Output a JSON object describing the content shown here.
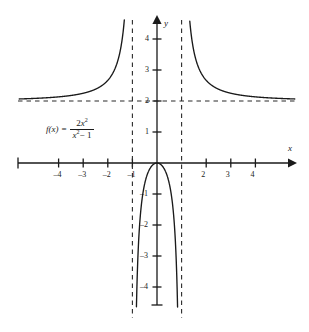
{
  "figure": {
    "background_color": "#ffffff",
    "ink_color": "#1a1a1a"
  },
  "function_label": {
    "f_name": "f(x)",
    "equals": "=",
    "numerator_coefficient": "2",
    "numerator_variable": "x",
    "numerator_exponent": "2",
    "denominator_variable": "x",
    "denominator_exponent": "2",
    "denominator_rest": "− 1",
    "plain_text": "f(x) = 2x^2 / (x^2 - 1)"
  },
  "axes": {
    "x_axis_name": "x",
    "y_axis_name": "y",
    "x_ticks": [
      {
        "value": -4,
        "label": "–4"
      },
      {
        "value": -3,
        "label": "–3"
      },
      {
        "value": -2,
        "label": "–2"
      },
      {
        "value": -1,
        "label": "–1"
      },
      {
        "value": 2,
        "label": "2"
      },
      {
        "value": 3,
        "label": "3"
      },
      {
        "value": 4,
        "label": "4"
      }
    ],
    "y_ticks": [
      {
        "value": 4,
        "label": "4"
      },
      {
        "value": 3,
        "label": "3"
      },
      {
        "value": 2,
        "label": "2"
      },
      {
        "value": 1,
        "label": "1"
      },
      {
        "value": -1,
        "label": "–1"
      },
      {
        "value": -2,
        "label": "–2"
      },
      {
        "value": -3,
        "label": "–3"
      },
      {
        "value": -4,
        "label": "–4"
      }
    ]
  },
  "chart_data": {
    "type": "line",
    "title": "",
    "subtitle": "",
    "xlabel": "x",
    "ylabel": "y",
    "grid": false,
    "legend": "none",
    "annotations": [
      {
        "text": "f(x) = 2x^2/(x^2 - 1)",
        "x": -3.6,
        "y": 1.35
      }
    ],
    "function": "f(x) = 2*x^2/(x^2 - 1)",
    "xlim": [
      -5.5,
      5.7
    ],
    "ylim": [
      -4.8,
      5.2
    ],
    "x_ticks": [
      -4,
      -3,
      -2,
      -1,
      2,
      3,
      4
    ],
    "y_ticks": [
      4,
      3,
      2,
      1,
      -1,
      -2,
      -3,
      -4
    ],
    "x_tick_labels": [
      "–4",
      "–3",
      "–2",
      "–1",
      "2",
      "3",
      "4"
    ],
    "y_tick_labels": [
      "4",
      "3",
      "2",
      "1",
      "–1",
      "–2",
      "–3",
      "–4"
    ],
    "asymptotes": [
      {
        "kind": "vertical",
        "value": -1,
        "style": "dashed",
        "label": "x = -1"
      },
      {
        "kind": "vertical",
        "value": 1,
        "style": "dashed",
        "label": "x = 1"
      },
      {
        "kind": "horizontal",
        "value": 2,
        "style": "dashed",
        "label": "y = 2"
      }
    ],
    "series": [
      {
        "name": "left branch (x < -1)",
        "x": [
          -5.5,
          -5.0,
          -4.5,
          -4.0,
          -3.5,
          -3.0,
          -2.75,
          -2.5,
          -2.25,
          -2.0,
          -1.9,
          -1.8,
          -1.7,
          -1.6,
          -1.5,
          -1.4,
          -1.35,
          -1.3,
          -1.25,
          -1.2,
          -1.16,
          -1.13,
          -1.1
        ],
        "y": [
          2.139,
          2.167,
          2.208,
          2.133,
          2.178,
          2.25,
          2.293,
          2.381,
          2.509,
          2.667,
          2.756,
          2.866,
          3.006,
          3.188,
          3.6,
          4.083,
          4.413,
          4.869,
          5.556,
          6.545,
          7.72,
          8.95,
          10.48
        ]
      },
      {
        "name": "middle branch (-1 < x < 1)",
        "x": [
          -0.93,
          -0.9,
          -0.87,
          -0.85,
          -0.8,
          -0.75,
          -0.7,
          -0.6,
          -0.5,
          -0.4,
          -0.3,
          -0.2,
          -0.1,
          0,
          0.1,
          0.2,
          0.3,
          0.4,
          0.5,
          0.6,
          0.7,
          0.75,
          0.8,
          0.85,
          0.87,
          0.9,
          0.93
        ],
        "y": [
          -12.78,
          -8.53,
          -6.35,
          -5.4,
          -3.56,
          -2.57,
          -1.92,
          -1.125,
          -0.667,
          -0.381,
          -0.198,
          -0.083,
          -0.02,
          0,
          -0.02,
          -0.083,
          -0.198,
          -0.381,
          -0.667,
          -1.125,
          -1.92,
          -2.57,
          -3.56,
          -5.4,
          -6.35,
          -8.53,
          -12.78
        ]
      },
      {
        "name": "right branch (x > 1)",
        "x": [
          1.1,
          1.13,
          1.16,
          1.2,
          1.25,
          1.3,
          1.35,
          1.4,
          1.5,
          1.6,
          1.7,
          1.8,
          1.9,
          2.0,
          2.25,
          2.5,
          2.75,
          3.0,
          3.5,
          4.0,
          4.5,
          5.0,
          5.5
        ],
        "y": [
          10.48,
          8.95,
          7.72,
          6.545,
          5.556,
          4.869,
          4.413,
          4.083,
          3.6,
          3.188,
          3.006,
          2.866,
          2.756,
          2.667,
          2.509,
          2.381,
          2.293,
          2.25,
          2.178,
          2.133,
          2.208,
          2.167,
          2.139
        ]
      }
    ]
  }
}
